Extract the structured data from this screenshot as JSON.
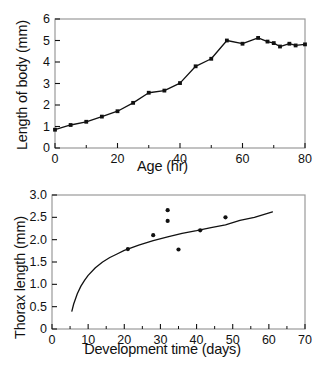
{
  "figure": {
    "background_color": "#ffffff",
    "ink_color": "#111111",
    "frame_color": "#9a9a9a",
    "panels": [
      {
        "id": "top",
        "chart_data": {
          "type": "line",
          "title": "",
          "xlabel": "Age (hr)",
          "ylabel": "Length of body (mm)",
          "xlim": [
            0,
            80
          ],
          "ylim": [
            0,
            6
          ],
          "xticks": [
            0,
            20,
            40,
            60,
            80
          ],
          "xtick_labels": [
            "0",
            "20",
            "40",
            "60",
            "80"
          ],
          "xminor_ticks": [
            10,
            30,
            50,
            70
          ],
          "yticks": [
            0,
            1,
            2,
            3,
            4,
            5,
            6
          ],
          "ytick_labels": [
            "0",
            "1",
            "2",
            "3",
            "4",
            "5",
            "6"
          ],
          "grid": false,
          "legend": "none",
          "marker": "filled-square",
          "series": [
            {
              "name": "Body length vs age",
              "x": [
                0,
                5,
                10,
                15,
                20,
                25,
                30,
                35,
                40,
                45,
                50,
                55,
                60,
                65,
                68,
                70,
                72,
                75,
                77,
                80
              ],
              "y": [
                0.85,
                1.07,
                1.22,
                1.46,
                1.71,
                2.1,
                2.57,
                2.67,
                3.02,
                3.8,
                4.15,
                5.0,
                4.85,
                5.12,
                4.95,
                4.88,
                4.72,
                4.85,
                4.77,
                4.82
              ]
            }
          ]
        }
      },
      {
        "id": "bottom",
        "chart_data": {
          "type": "scatter",
          "title": "",
          "xlabel": "Development time (days)",
          "ylabel": "Thorax length (mm)",
          "xlim": [
            0,
            70
          ],
          "ylim": [
            0,
            3.0
          ],
          "xticks": [
            0,
            10,
            20,
            30,
            40,
            50,
            60,
            70
          ],
          "xtick_labels": [
            "0",
            "10",
            "20",
            "30",
            "40",
            "50",
            "60",
            "70"
          ],
          "xminor_ticks": [
            5,
            15,
            25,
            35,
            45,
            55,
            65
          ],
          "yticks": [
            0,
            0.5,
            1.0,
            1.5,
            2.0,
            2.5,
            3.0
          ],
          "ytick_labels": [
            "0",
            "0.5",
            "1.0",
            "1.5",
            "2.0",
            "2.5",
            "3.0"
          ],
          "grid": false,
          "legend": "none",
          "marker": "filled-circle",
          "series": [
            {
              "name": "Observed thorax length",
              "type": "scatter",
              "x": [
                21,
                28,
                32,
                32,
                35,
                41,
                48
              ],
              "y": [
                1.79,
                2.1,
                2.66,
                2.42,
                1.78,
                2.21,
                2.5
              ]
            },
            {
              "name": "Fitted growth curve",
              "type": "line",
              "x": [
                5.5,
                6,
                7,
                8,
                9,
                10,
                12,
                14,
                16,
                18,
                20,
                24,
                28,
                32,
                36,
                40,
                44,
                48,
                52,
                56,
                61
              ],
              "y": [
                0.4,
                0.56,
                0.79,
                0.96,
                1.09,
                1.2,
                1.37,
                1.5,
                1.6,
                1.68,
                1.76,
                1.88,
                1.98,
                2.06,
                2.14,
                2.2,
                2.27,
                2.33,
                2.43,
                2.5,
                2.62
              ]
            }
          ]
        }
      }
    ]
  }
}
